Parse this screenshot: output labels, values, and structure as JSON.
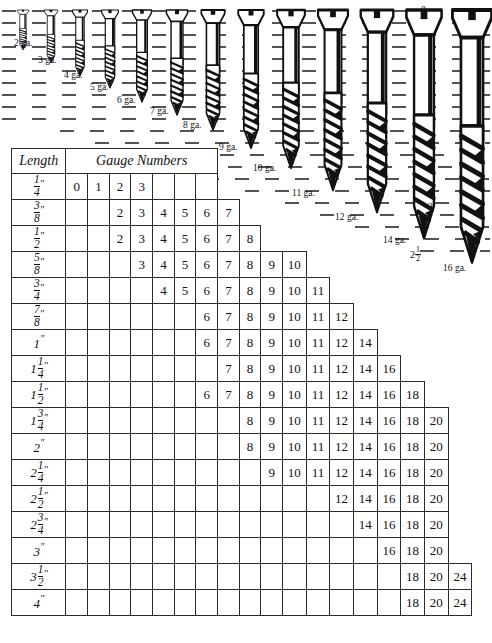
{
  "screw_diagram": {
    "gauge_labels": [
      {
        "text": "2 ga.",
        "x": 14,
        "y": 38
      },
      {
        "text": "3 ga.",
        "x": 38,
        "y": 55
      },
      {
        "text": "4 ga.",
        "x": 64,
        "y": 70
      },
      {
        "text": "5 ga.",
        "x": 90,
        "y": 82
      },
      {
        "text": "6 ga.",
        "x": 117,
        "y": 95
      },
      {
        "text": "7 ga.",
        "x": 150,
        "y": 106
      },
      {
        "text": "8 ga.",
        "x": 183,
        "y": 120
      },
      {
        "text": "9 ga.",
        "x": 219,
        "y": 142
      },
      {
        "text": "10 ga.",
        "x": 253,
        "y": 163
      },
      {
        "text": "11 ga.",
        "x": 292,
        "y": 188
      },
      {
        "text": "12 ga.",
        "x": 335,
        "y": 212
      },
      {
        "text": "14 ga.",
        "x": 383,
        "y": 235
      },
      {
        "text": "16 ga.",
        "x": 443,
        "y": 263
      }
    ],
    "ruler_numbers": [
      {
        "text": "0",
        "x": 421,
        "y": 6
      },
      {
        "text": "1",
        "x": 427,
        "y": 107
      },
      {
        "text": "2",
        "x": 428,
        "y": 207
      }
    ],
    "ruler_fraction": {
      "whole": "2",
      "numerator": "1",
      "denominator": "2",
      "x": 413,
      "y": 250
    }
  },
  "table": {
    "header": {
      "length": "Length",
      "gauge_numbers": "Gauge Numbers"
    },
    "column_count": 19,
    "rows": [
      {
        "length": {
          "whole": "",
          "num": "1",
          "den": "4",
          "plain": ""
        },
        "cells": [
          "0",
          "1",
          "2",
          "3",
          "",
          "",
          "",
          "",
          "",
          "",
          "",
          "",
          "",
          "",
          "",
          "",
          "",
          "",
          ""
        ],
        "span": 7
      },
      {
        "length": {
          "whole": "",
          "num": "3",
          "den": "8",
          "plain": ""
        },
        "cells": [
          "",
          "",
          "2",
          "3",
          "4",
          "5",
          "6",
          "7",
          "",
          "",
          "",
          "",
          "",
          "",
          "",
          "",
          "",
          "",
          ""
        ],
        "span": 8
      },
      {
        "length": {
          "whole": "",
          "num": "1",
          "den": "2",
          "plain": ""
        },
        "cells": [
          "",
          "",
          "2",
          "3",
          "4",
          "5",
          "6",
          "7",
          "8",
          "",
          "",
          "",
          "",
          "",
          "",
          "",
          "",
          "",
          ""
        ],
        "span": 9
      },
      {
        "length": {
          "whole": "",
          "num": "5",
          "den": "8",
          "plain": ""
        },
        "cells": [
          "",
          "",
          "",
          "3",
          "4",
          "5",
          "6",
          "7",
          "8",
          "9",
          "10",
          "",
          "",
          "",
          "",
          "",
          "",
          "",
          ""
        ],
        "span": 11
      },
      {
        "length": {
          "whole": "",
          "num": "3",
          "den": "4",
          "plain": ""
        },
        "cells": [
          "",
          "",
          "",
          "",
          "4",
          "5",
          "6",
          "7",
          "8",
          "9",
          "10",
          "11",
          "",
          "",
          "",
          "",
          "",
          "",
          ""
        ],
        "span": 12
      },
      {
        "length": {
          "whole": "",
          "num": "7",
          "den": "8",
          "plain": ""
        },
        "cells": [
          "",
          "",
          "",
          "",
          "",
          "",
          "6",
          "7",
          "8",
          "9",
          "10",
          "11",
          "12",
          "",
          "",
          "",
          "",
          "",
          ""
        ],
        "span": 13
      },
      {
        "length": {
          "whole": "",
          "num": "",
          "den": "",
          "plain": "1"
        },
        "cells": [
          "",
          "",
          "",
          "",
          "",
          "",
          "6",
          "7",
          "8",
          "9",
          "10",
          "11",
          "12",
          "14",
          "",
          "",
          "",
          "",
          ""
        ],
        "span": 14
      },
      {
        "length": {
          "whole": "1",
          "num": "1",
          "den": "4",
          "plain": ""
        },
        "cells": [
          "",
          "",
          "",
          "",
          "",
          "",
          "",
          "7",
          "8",
          "9",
          "10",
          "11",
          "12",
          "14",
          "16",
          "",
          "",
          "",
          ""
        ],
        "span": 15
      },
      {
        "length": {
          "whole": "1",
          "num": "1",
          "den": "2",
          "plain": ""
        },
        "cells": [
          "",
          "",
          "",
          "",
          "",
          "",
          "6",
          "7",
          "8",
          "9",
          "10",
          "11",
          "12",
          "14",
          "16",
          "18",
          "",
          "",
          ""
        ],
        "span": 16
      },
      {
        "length": {
          "whole": "1",
          "num": "3",
          "den": "4",
          "plain": ""
        },
        "cells": [
          "",
          "",
          "",
          "",
          "",
          "",
          "",
          "",
          "8",
          "9",
          "10",
          "11",
          "12",
          "14",
          "16",
          "18",
          "20",
          "",
          ""
        ],
        "span": 17
      },
      {
        "length": {
          "whole": "",
          "num": "",
          "den": "",
          "plain": "2"
        },
        "cells": [
          "",
          "",
          "",
          "",
          "",
          "",
          "",
          "",
          "8",
          "9",
          "10",
          "11",
          "12",
          "14",
          "16",
          "18",
          "20",
          "",
          ""
        ],
        "span": 17
      },
      {
        "length": {
          "whole": "2",
          "num": "1",
          "den": "4",
          "plain": ""
        },
        "cells": [
          "",
          "",
          "",
          "",
          "",
          "",
          "",
          "",
          "",
          "9",
          "10",
          "11",
          "12",
          "14",
          "16",
          "18",
          "20",
          "",
          ""
        ],
        "span": 17
      },
      {
        "length": {
          "whole": "2",
          "num": "1",
          "den": "2",
          "plain": ""
        },
        "cells": [
          "",
          "",
          "",
          "",
          "",
          "",
          "",
          "",
          "",
          "",
          "",
          "",
          "12",
          "14",
          "16",
          "18",
          "20",
          "",
          ""
        ],
        "span": 17
      },
      {
        "length": {
          "whole": "2",
          "num": "3",
          "den": "4",
          "plain": ""
        },
        "cells": [
          "",
          "",
          "",
          "",
          "",
          "",
          "",
          "",
          "",
          "",
          "",
          "",
          "",
          "14",
          "16",
          "18",
          "20",
          "",
          ""
        ],
        "span": 17
      },
      {
        "length": {
          "whole": "",
          "num": "",
          "den": "",
          "plain": "3"
        },
        "cells": [
          "",
          "",
          "",
          "",
          "",
          "",
          "",
          "",
          "",
          "",
          "",
          "",
          "",
          "",
          "16",
          "18",
          "20",
          "",
          ""
        ],
        "span": 17
      },
      {
        "length": {
          "whole": "3",
          "num": "1",
          "den": "2",
          "plain": ""
        },
        "cells": [
          "",
          "",
          "",
          "",
          "",
          "",
          "",
          "",
          "",
          "",
          "",
          "",
          "",
          "",
          "",
          "18",
          "20",
          "24",
          ""
        ],
        "span": 18
      },
      {
        "length": {
          "whole": "",
          "num": "",
          "den": "",
          "plain": "4"
        },
        "cells": [
          "",
          "",
          "",
          "",
          "",
          "",
          "",
          "",
          "",
          "",
          "",
          "",
          "",
          "",
          "",
          "18",
          "20",
          "24",
          ""
        ],
        "span": 18
      }
    ]
  },
  "colors": {
    "ink": "#111111",
    "rule": "#2b2b2b",
    "paper": "#ffffff"
  }
}
